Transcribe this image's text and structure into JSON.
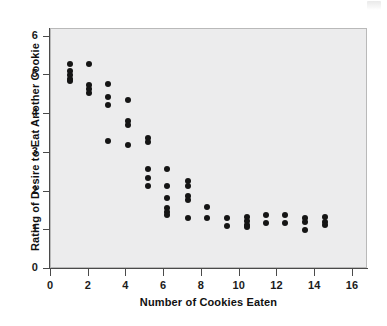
{
  "chart_data": {
    "type": "scatter",
    "title": "",
    "xlabel": "Number of Cookies Eaten",
    "ylabel": "Rating of Desire to Eat Another Cookie",
    "xlim": [
      0,
      16.8
    ],
    "ylim": [
      0,
      6.2
    ],
    "xticks": [
      0,
      2,
      4,
      6,
      8,
      10,
      12,
      14,
      16
    ],
    "yticks": [
      0,
      1,
      2,
      3,
      4,
      5,
      6
    ],
    "xtick_labels": [
      "0",
      "2",
      "4",
      "6",
      "8",
      "10",
      "12",
      "14",
      "16"
    ],
    "ytick_labels": [
      "0",
      "1",
      "2",
      "3",
      "4",
      "5",
      "6"
    ],
    "grid": false,
    "legend": false,
    "marker": "filled-circle",
    "marker_color": "#151515",
    "plot_background": "#ececed",
    "points": [
      {
        "x": 1.05,
        "y": 5.27
      },
      {
        "x": 1.05,
        "y": 5.08
      },
      {
        "x": 1.05,
        "y": 4.98
      },
      {
        "x": 1.05,
        "y": 4.88
      },
      {
        "x": 1.05,
        "y": 4.82
      },
      {
        "x": 2.08,
        "y": 5.27
      },
      {
        "x": 2.08,
        "y": 4.73
      },
      {
        "x": 2.08,
        "y": 4.62
      },
      {
        "x": 2.08,
        "y": 4.52
      },
      {
        "x": 3.1,
        "y": 4.75
      },
      {
        "x": 3.1,
        "y": 4.42
      },
      {
        "x": 3.1,
        "y": 4.22
      },
      {
        "x": 3.1,
        "y": 3.27
      },
      {
        "x": 4.12,
        "y": 4.33
      },
      {
        "x": 4.12,
        "y": 3.8
      },
      {
        "x": 4.12,
        "y": 3.7
      },
      {
        "x": 4.12,
        "y": 3.17
      },
      {
        "x": 5.18,
        "y": 3.35
      },
      {
        "x": 5.18,
        "y": 3.25
      },
      {
        "x": 5.18,
        "y": 2.55
      },
      {
        "x": 5.18,
        "y": 2.33
      },
      {
        "x": 5.18,
        "y": 2.12
      },
      {
        "x": 6.22,
        "y": 2.55
      },
      {
        "x": 6.22,
        "y": 2.12
      },
      {
        "x": 6.22,
        "y": 1.82
      },
      {
        "x": 6.22,
        "y": 1.55
      },
      {
        "x": 6.22,
        "y": 1.45
      },
      {
        "x": 6.22,
        "y": 1.37
      },
      {
        "x": 7.3,
        "y": 2.25
      },
      {
        "x": 7.3,
        "y": 2.12
      },
      {
        "x": 7.3,
        "y": 1.85
      },
      {
        "x": 7.3,
        "y": 1.75
      },
      {
        "x": 7.3,
        "y": 1.3
      },
      {
        "x": 8.32,
        "y": 1.58
      },
      {
        "x": 8.32,
        "y": 1.3
      },
      {
        "x": 9.38,
        "y": 1.3
      },
      {
        "x": 9.38,
        "y": 1.08
      },
      {
        "x": 10.42,
        "y": 1.32
      },
      {
        "x": 10.42,
        "y": 1.22
      },
      {
        "x": 10.42,
        "y": 1.12
      },
      {
        "x": 10.42,
        "y": 1.05
      },
      {
        "x": 11.45,
        "y": 1.38
      },
      {
        "x": 11.45,
        "y": 1.17
      },
      {
        "x": 12.48,
        "y": 1.37
      },
      {
        "x": 12.48,
        "y": 1.17
      },
      {
        "x": 13.52,
        "y": 1.3
      },
      {
        "x": 13.52,
        "y": 1.2
      },
      {
        "x": 13.52,
        "y": 0.98
      },
      {
        "x": 14.55,
        "y": 1.32
      },
      {
        "x": 14.55,
        "y": 1.2
      },
      {
        "x": 14.55,
        "y": 1.1
      }
    ]
  }
}
